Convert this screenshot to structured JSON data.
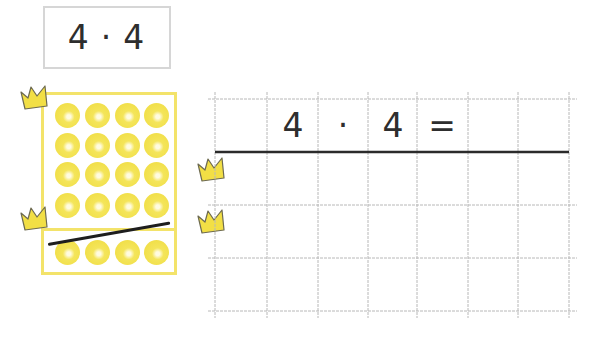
{
  "task": {
    "left": "4",
    "operator": "·",
    "right": "4"
  },
  "dot_field": {
    "rows_full": 4,
    "columns": 4,
    "crossed_rows": 1,
    "dot_color": "#f0de46",
    "frame_color": "#f3e36a"
  },
  "grid": {
    "equation_cells": [
      "4",
      "·",
      "4",
      "="
    ],
    "line_color": "#b5b5b5",
    "rule_color": "#2b2b2b"
  },
  "icons": {
    "crown": "crown-icon"
  }
}
